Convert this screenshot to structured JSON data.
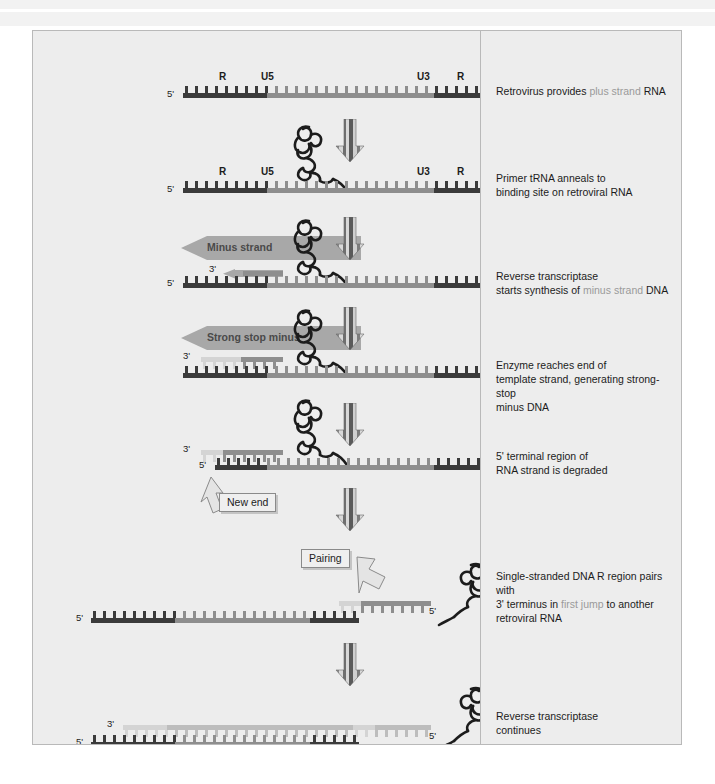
{
  "figure": {
    "panel_bg": "#ededed",
    "border_color": "#b9b9b9",
    "colors": {
      "r_region": "#3b3b3b",
      "u5_region": "#3b3b3b",
      "u3_region": "#3b3b3b",
      "body_rna": "#8e8e8e",
      "dna_minus": "#8e8e8e",
      "degraded": "#d4d4d4",
      "highlight_text": "#9a9a9a",
      "body_text": "#1c1c1c"
    }
  },
  "captions": [
    {
      "id": "step1",
      "pre": "Retrovirus provides ",
      "hl": "plus strand",
      "post": " RNA",
      "line2": "",
      "line3": ""
    },
    {
      "id": "step2",
      "pre": "Primer tRNA anneals to",
      "hl": "",
      "post": "",
      "line2": "binding site on retroviral RNA",
      "line3": ""
    },
    {
      "id": "step3",
      "pre": "Reverse transcriptase",
      "hl": "",
      "post": "",
      "line2_pre": "starts synthesis of ",
      "line2_hl": "minus strand",
      "line2_post": " DNA",
      "line3": ""
    },
    {
      "id": "step4",
      "pre": "Enzyme reaches end of",
      "hl": "",
      "post": "",
      "line2": "template strand, generating strong-stop",
      "line3": "minus DNA"
    },
    {
      "id": "step5",
      "pre": "5' terminal region of",
      "hl": "",
      "post": "",
      "line2": "RNA strand is degraded",
      "line3": ""
    },
    {
      "id": "step6",
      "pre": "Single-stranded DNA R region pairs with",
      "hl": "",
      "post": "",
      "line2_pre": "3' terminus in ",
      "line2_hl": "first jump",
      "line2_post": " to another",
      "line3": "retroviral RNA"
    },
    {
      "id": "step7",
      "pre": "Reverse transcriptase",
      "hl": "",
      "post": "",
      "line2": "continues",
      "line3": ""
    }
  ],
  "region_labels": {
    "R": "R",
    "U5": "U5",
    "U3": "U3"
  },
  "end_labels": {
    "five_prime": "5'",
    "three_prime": "3'"
  },
  "banner_labels": {
    "minus_strand": "Minus strand",
    "strong_stop_minus": "Strong stop minus"
  },
  "callout_labels": {
    "new_end": "New end",
    "pairing": "Pairing"
  },
  "icons": {
    "process_arrow": "striped-down-arrow",
    "trna": "trna-cloverleaf-squiggle",
    "callout_arrow": "outline-pointer-arrow"
  }
}
